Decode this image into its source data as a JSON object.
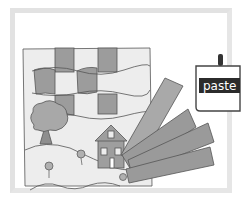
{
  "illustration": {
    "title": "Paper weaving collage with paste",
    "paste_label": "paste",
    "colors": {
      "background": "#ffffff",
      "frame": "#e2e2e2",
      "paper": "#ececec",
      "strip_dark": "#9a9a9a",
      "strip_mid": "#a8a8a8",
      "outline": "#555555",
      "label_bg": "#2b2b2b",
      "label_text": "#ffffff"
    },
    "elements": [
      "woven-checkerboard",
      "tree",
      "house",
      "flowers",
      "hills",
      "paper-strips-fan",
      "paste-jar"
    ]
  }
}
